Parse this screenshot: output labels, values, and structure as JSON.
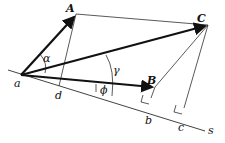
{
  "diagram": {
    "type": "vector-projection",
    "points": {
      "a": {
        "label": "a",
        "x": 21,
        "y": 75
      },
      "A": {
        "label": "A",
        "x": 76,
        "y": 14
      },
      "B": {
        "label": "B",
        "x": 155,
        "y": 87
      },
      "C": {
        "label": "C",
        "x": 208,
        "y": 25
      },
      "d": {
        "label": "d",
        "x": 59,
        "y": 86
      },
      "b": {
        "label": "b",
        "x": 151,
        "y": 98
      },
      "c": {
        "label": "c",
        "x": 184,
        "y": 108
      }
    },
    "axis_label": "s",
    "angles": {
      "alpha": "α",
      "gamma": "γ",
      "phi": "ϕ"
    },
    "vectors": [
      "aA",
      "aB",
      "aC"
    ],
    "stroke_color": "#111111",
    "background": "#ffffff"
  }
}
